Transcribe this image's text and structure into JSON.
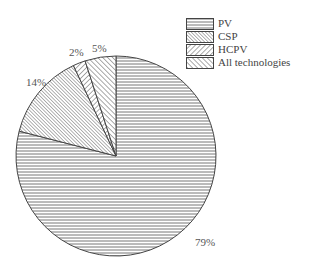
{
  "chart_data": {
    "type": "pie",
    "title": "",
    "categories": [
      "PV",
      "CSP",
      "HCPV",
      "All technologies"
    ],
    "values": [
      79,
      14,
      2,
      5
    ],
    "unit": "%",
    "data_labels": [
      "79%",
      "14%",
      "2%",
      "5%"
    ],
    "slice_order_clockwise_from_top": [
      "PV",
      "CSP",
      "HCPV",
      "All technologies"
    ],
    "patterns": {
      "PV": "horizontal-lines",
      "CSP": "fine-backslash-hatch",
      "HCPV": "forward-slash-hatch",
      "All technologies": "backslash-hatch"
    },
    "legend_position": "top-right",
    "grid": false
  },
  "legend": {
    "items": [
      {
        "label": "PV",
        "pattern": "horizontal-lines"
      },
      {
        "label": "CSP",
        "pattern": "fine-backslash-hatch"
      },
      {
        "label": "HCPV",
        "pattern": "forward-slash-hatch"
      },
      {
        "label": "All technologies",
        "pattern": "backslash-hatch"
      }
    ]
  },
  "labels": {
    "pv": "79%",
    "csp": "14%",
    "hcpv": "2%",
    "all": "5%"
  }
}
